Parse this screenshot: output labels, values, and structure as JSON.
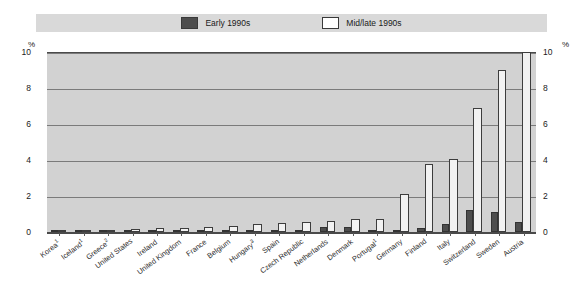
{
  "legend": {
    "items": [
      {
        "label": "Early 1990s",
        "swatch": "dark-filled",
        "color": "#4d4d4d"
      },
      {
        "label": "Mid/late 1990s",
        "swatch": "white-outline",
        "color": "#ffffff"
      }
    ]
  },
  "axis": {
    "unit_left": "%",
    "unit_right": "%",
    "yticks": [
      "0",
      "2",
      "4",
      "6",
      "8",
      "10"
    ]
  },
  "colors": {
    "plot_background": "#d2d2d2",
    "legend_background": "#d9d9d9",
    "early_series": "#4d4d4d",
    "mid_series": "#f2f2f2",
    "gridline": "#7b7b7b",
    "axis_line": "#4a4a4a",
    "text": "#1a1a1a"
  },
  "chart_data": {
    "type": "bar",
    "title": "",
    "xlabel": "",
    "ylabel": "%",
    "ylim": [
      0,
      10
    ],
    "yticks": [
      0,
      2,
      4,
      6,
      8,
      10
    ],
    "grid": true,
    "legend_position": "top-center",
    "categories": [
      "Korea",
      "Iceland",
      "Greece",
      "United States",
      "Ireland",
      "United Kingdom",
      "France",
      "Belgium",
      "Hungary",
      "Spain",
      "Czech Republic",
      "Netherlands",
      "Denmark",
      "Portugal",
      "Germany",
      "Finland",
      "Italy",
      "Switzerland",
      "Sweden",
      "Austria"
    ],
    "category_footnotes": [
      "1",
      "1",
      "2",
      "",
      "",
      "",
      "",
      "",
      "3",
      "",
      "",
      "",
      "",
      "1",
      "",
      "",
      "",
      "",
      "",
      ""
    ],
    "series": [
      {
        "name": "Early 1990s",
        "values": [
          0.0,
          0.0,
          0.0,
          0.0,
          0.05,
          0.05,
          0.1,
          0.1,
          0.05,
          0.1,
          0.1,
          0.3,
          0.3,
          0.1,
          0.05,
          0.2,
          0.45,
          1.2,
          1.1,
          0.55
        ]
      },
      {
        "name": "Mid/late 1990s",
        "values": [
          0.05,
          0.05,
          0.1,
          0.15,
          0.2,
          0.25,
          0.3,
          0.35,
          0.45,
          0.5,
          0.55,
          0.6,
          0.7,
          0.75,
          2.1,
          3.8,
          4.05,
          6.9,
          9.0,
          10.0
        ]
      }
    ]
  }
}
